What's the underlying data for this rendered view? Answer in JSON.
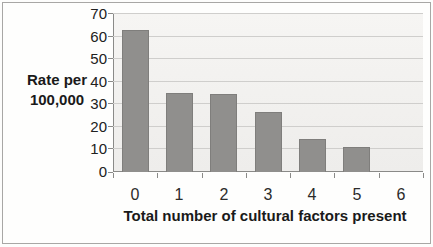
{
  "chart_data": {
    "type": "bar",
    "categories": [
      "0",
      "1",
      "2",
      "3",
      "4",
      "5",
      "6"
    ],
    "values": [
      63,
      35,
      34.5,
      26.5,
      14.5,
      11,
      0
    ],
    "title": "",
    "xlabel": "Total number of cultural factors present",
    "ylabel": "Rate per 100,000",
    "ylabel_line1": "Rate per",
    "ylabel_line2": "100,000",
    "yticks": [
      0,
      10,
      20,
      30,
      40,
      50,
      60,
      70
    ],
    "ylim": [
      0,
      70
    ],
    "grid": true,
    "legend": "none",
    "bar_color": "#908f8d",
    "bar_border_color": "#7f7e7c",
    "gridline_color": "#cfcecc",
    "axis_color": "#8a8a88"
  }
}
